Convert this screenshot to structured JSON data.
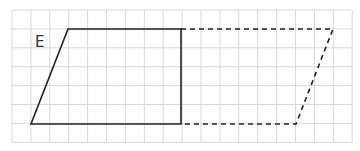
{
  "diagram": {
    "label": "E",
    "label_pos": [
      35,
      47
    ],
    "grid": {
      "x0": 12,
      "y0": 10,
      "cols": 18,
      "rows": 7,
      "cell": 18.9,
      "color": "#d9d9d9"
    },
    "solid_shape": {
      "points": [
        [
          68,
          29
        ],
        [
          181,
          29
        ],
        [
          181,
          124
        ],
        [
          31,
          124
        ]
      ],
      "color": "#222222"
    },
    "dashed_shape": {
      "points": [
        [
          181,
          29
        ],
        [
          333,
          29
        ],
        [
          296,
          124
        ],
        [
          181,
          124
        ]
      ],
      "color": "#222222"
    }
  }
}
